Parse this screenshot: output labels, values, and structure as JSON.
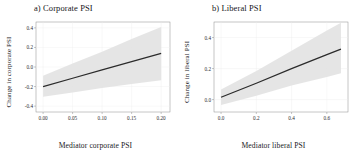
{
  "figure": {
    "background": "#ffffff",
    "band_color": "#e2e2e2",
    "line_color": "#2b2b2b",
    "axis_color": "#8c8c8c",
    "grid_color": "#ededed"
  },
  "panels": [
    {
      "id": "a",
      "title": "a) Corporate PSI",
      "xlabel": "Mediator corporate PSI",
      "ylabel": "Change in corporate PSI"
    },
    {
      "id": "b",
      "title": "b) Liberal PSI",
      "xlabel": "Mediator liberal PSI",
      "ylabel": "Change in liberal PSI"
    }
  ],
  "chart_data": [
    {
      "type": "line",
      "panel": "a",
      "title": "a) Corporate PSI",
      "xlabel": "Mediator corporate PSI",
      "ylabel": "Change in corporate PSI",
      "xlim": [
        -0.012,
        0.215
      ],
      "ylim": [
        -0.46,
        0.46
      ],
      "xticks": [
        0.0,
        0.05,
        0.1,
        0.15,
        0.2
      ],
      "xticklabels": [
        "0.00",
        "0.05",
        "0.10",
        "0.15",
        "0.20"
      ],
      "yticks": [
        -0.4,
        -0.2,
        0.0,
        0.2,
        0.4
      ],
      "yticklabels": [
        "-0.4",
        "-0.2",
        "0.0",
        "0.2",
        "0.4"
      ],
      "grid": true,
      "legend": "none",
      "series": [
        {
          "name": "fit",
          "x": [
            0.0,
            0.05,
            0.1,
            0.15,
            0.2
          ],
          "y": [
            -0.2,
            -0.115,
            -0.03,
            0.055,
            0.14
          ]
        },
        {
          "name": "ci_upper",
          "x": [
            0.0,
            0.05,
            0.1,
            0.15,
            0.2
          ],
          "y": [
            -0.09,
            0.035,
            0.155,
            0.285,
            0.41
          ]
        },
        {
          "name": "ci_lower",
          "x": [
            0.0,
            0.05,
            0.1,
            0.15,
            0.2
          ],
          "y": [
            -0.305,
            -0.26,
            -0.215,
            -0.175,
            -0.135
          ]
        }
      ]
    },
    {
      "type": "line",
      "panel": "b",
      "title": "b) Liberal PSI",
      "xlabel": "Mediator liberal PSI",
      "ylabel": "Change in liberal PSI",
      "xlim": [
        -0.04,
        0.72
      ],
      "ylim": [
        -0.08,
        0.5
      ],
      "xticks": [
        0.0,
        0.2,
        0.4,
        0.6
      ],
      "xticklabels": [
        "0.0",
        "0.2",
        "0.4",
        "0.6"
      ],
      "yticks": [
        0.0,
        0.2,
        0.4
      ],
      "yticklabels": [
        "0.0",
        "0.2",
        "0.4"
      ],
      "grid": true,
      "legend": "none",
      "series": [
        {
          "name": "fit",
          "x": [
            0.0,
            0.2,
            0.4,
            0.6,
            0.68
          ],
          "y": [
            0.015,
            0.105,
            0.2,
            0.29,
            0.325
          ]
        },
        {
          "name": "ci_upper",
          "x": [
            0.0,
            0.2,
            0.4,
            0.6,
            0.68
          ],
          "y": [
            0.065,
            0.185,
            0.315,
            0.445,
            0.495
          ]
        },
        {
          "name": "ci_lower",
          "x": [
            0.0,
            0.2,
            0.4,
            0.6,
            0.68
          ],
          "y": [
            -0.035,
            0.025,
            0.09,
            0.145,
            0.17
          ]
        }
      ]
    }
  ]
}
